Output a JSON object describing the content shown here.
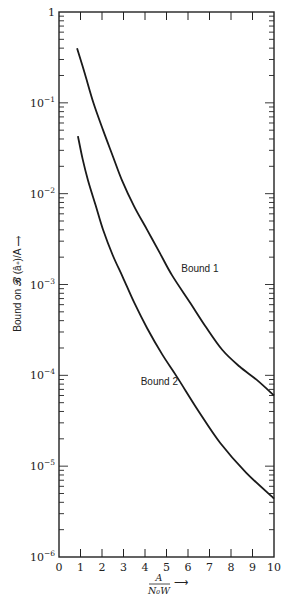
{
  "chart_data": {
    "type": "line",
    "title": "",
    "xlabel": {
      "numerator": "A",
      "denominator": "N₀W",
      "arrow": "⟶"
    },
    "ylabel": "Bound on 𝓑 (â∗)/A ⟶",
    "x_scale": "linear",
    "y_scale": "log",
    "xlim": [
      0,
      10
    ],
    "ylim": [
      1e-06,
      1
    ],
    "x_ticks": [
      "0",
      "1",
      "2",
      "3",
      "4",
      "5",
      "6",
      "7",
      "8",
      "9",
      "10"
    ],
    "y_ticks": [
      {
        "base": "1",
        "exp": ""
      },
      {
        "base": "10",
        "exp": "−1"
      },
      {
        "base": "10",
        "exp": "−2"
      },
      {
        "base": "10",
        "exp": "−3"
      },
      {
        "base": "10",
        "exp": "−4"
      },
      {
        "base": "10",
        "exp": "−5"
      },
      {
        "base": "10",
        "exp": "−6"
      }
    ],
    "grid": false,
    "legend": "none",
    "series": [
      {
        "name": "Bound 1",
        "label": "Bound 1",
        "x": [
          0.84,
          1.2,
          1.6,
          2.05,
          2.5,
          2.93,
          3.5,
          4.1,
          4.7,
          5.26,
          6.1,
          6.8,
          7.6,
          8.4,
          9.2,
          10.0
        ],
        "y": [
          0.4,
          0.21,
          0.1,
          0.05,
          0.026,
          0.014,
          0.0072,
          0.004,
          0.0022,
          0.00126,
          0.00063,
          0.00035,
          0.00019,
          0.000125,
          8.9e-05,
          6e-05
        ]
      },
      {
        "name": "Bound 2",
        "label": "Bound 2",
        "x": [
          0.88,
          1.1,
          1.35,
          1.7,
          2.05,
          2.5,
          2.97,
          3.5,
          4.1,
          4.8,
          5.5,
          6.5,
          7.5,
          8.7,
          10.0
        ],
        "y": [
          0.043,
          0.024,
          0.014,
          0.0075,
          0.004,
          0.0021,
          0.0012,
          0.00063,
          0.00033,
          0.00017,
          9.5e-05,
          4e-05,
          1.8e-05,
          8.5e-06,
          4.4e-06
        ]
      }
    ]
  }
}
